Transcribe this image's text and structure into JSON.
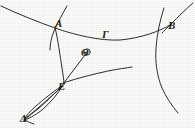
{
  "figure": {
    "style": {
      "background_color": "#fdfdfc",
      "ink_color": "#2a2a28",
      "stroke_width": 1.0
    },
    "labels": [
      {
        "id": "alpha",
        "text": "Α",
        "x": 55,
        "y": 18,
        "point": "A"
      },
      {
        "id": "gamma",
        "text": "Γ",
        "x": 102,
        "y": 29,
        "point": "G"
      },
      {
        "id": "beta",
        "text": "Β",
        "x": 168,
        "y": 20,
        "point": "B"
      },
      {
        "id": "theta",
        "text": "Θ",
        "x": 81,
        "y": 48,
        "point": "Th"
      },
      {
        "id": "epsilon",
        "text": "Ε",
        "x": 58,
        "y": 81,
        "point": "E"
      },
      {
        "id": "delta",
        "text": "Δ",
        "x": 20,
        "y": 113,
        "point": "D"
      }
    ],
    "curves": [
      {
        "id": "arc-alpha-gamma-beta",
        "name": "main-arc-through-alpha-gamma-beta",
        "d": "M 1 6 C 18 14, 38 22, 55 28 C 75 35, 100 41, 120 40 C 142 38, 160 31, 172 24"
      },
      {
        "id": "line-through-alpha",
        "name": "secant-line-at-alpha",
        "d": "M 67 6 C 63 13, 58 22, 54 31 C 51 38, 50 45, 50 50"
      },
      {
        "id": "curve-alpha-to-epsilon",
        "name": "curve-alpha-to-epsilon",
        "d": "M 55 27 C 58 40, 60 55, 62 68 C 63 75, 64 80, 64 84"
      },
      {
        "id": "line-through-beta",
        "name": "secant-line-at-beta",
        "d": "M 193 3 C 186 9, 178 17, 171 24 C 167 28, 164 31, 162 33"
      },
      {
        "id": "curve-beta-descend",
        "name": "curve-descending-from-beta",
        "d": "M 164 8 C 160 20, 157 34, 156 48 C 155 62, 157 76, 162 88 C 166 97, 172 106, 178 113"
      },
      {
        "id": "line-epsilon-theta",
        "name": "ray-epsilon-to-theta",
        "d": "M 63 84 L 88 51"
      },
      {
        "id": "curve-epsilon-right",
        "name": "curve-epsilon-to-right-edge",
        "d": "M 63 83 C 78 78, 94 74, 108 71 C 118 69, 126 68, 132 67"
      },
      {
        "id": "lens-outer-left",
        "name": "lens-outer-left-arc",
        "d": "M 63 85 C 54 91, 44 99, 36 106 C 30 111, 26 116, 24 120"
      },
      {
        "id": "lens-outer-right",
        "name": "lens-outer-right-arc",
        "d": "M 63 85 C 58 94, 50 103, 42 110 C 34 116, 28 119, 24 120"
      },
      {
        "id": "lens-inner-a",
        "name": "lens-inner-chord-a",
        "d": "M 63 86 C 55 93, 46 101, 38 108 C 32 113, 27 117, 24 120"
      },
      {
        "id": "lens-inner-b",
        "name": "lens-inner-chord-b",
        "d": "M 62 86 C 54 94, 46 102, 38 109 C 31 114, 27 118, 24 121"
      },
      {
        "id": "delta-tail",
        "name": "delta-tail-stroke",
        "d": "M 25 120 C 28 122, 31 123, 34 124"
      }
    ]
  }
}
